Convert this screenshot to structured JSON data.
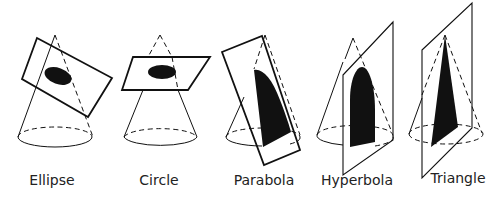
{
  "diagram": {
    "figures": [
      {
        "id": "ellipse",
        "label": "Ellipse",
        "label_x": 52
      },
      {
        "id": "circle",
        "label": "Circle",
        "label_x": 159
      },
      {
        "id": "parabola",
        "label": "Parabola",
        "label_x": 264
      },
      {
        "id": "hyperbola",
        "label": "Hyperbola",
        "label_x": 357
      },
      {
        "id": "triangle",
        "label": "Triangle",
        "label_x": 458
      }
    ],
    "colors": {
      "stroke": "#111111",
      "fill": "#111111",
      "background": "#ffffff"
    }
  }
}
